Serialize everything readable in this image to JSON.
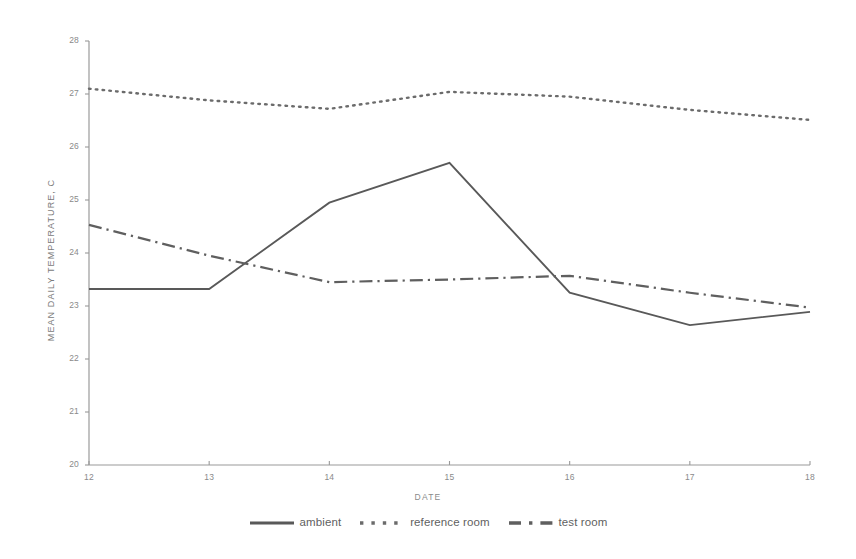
{
  "chart_data": {
    "type": "line",
    "title": "",
    "xlabel": "DATE",
    "ylabel": "MEAN DAILY TEMPERATURE, C",
    "x": [
      12,
      13,
      14,
      15,
      16,
      17,
      18
    ],
    "xlim": [
      12,
      18
    ],
    "ylim": [
      20,
      28
    ],
    "xticks": [
      "12",
      "13",
      "14",
      "15",
      "16",
      "17",
      "18"
    ],
    "yticks": [
      "20",
      "21",
      "22",
      "23",
      "24",
      "25",
      "26",
      "27",
      "28"
    ],
    "grid": false,
    "legend_position": "bottom",
    "series": [
      {
        "name": "ambient",
        "style": "solid",
        "color": "#595959",
        "values": [
          23.32,
          23.32,
          24.95,
          25.7,
          23.25,
          22.64,
          22.89
        ]
      },
      {
        "name": "reference room",
        "style": "dotted",
        "color": "#6b6b6b",
        "values": [
          27.1,
          26.88,
          26.72,
          27.04,
          26.95,
          26.7,
          26.51
        ]
      },
      {
        "name": "test room",
        "style": "dashdot",
        "color": "#5f5f5f",
        "values": [
          24.53,
          23.95,
          23.45,
          23.5,
          23.57,
          23.25,
          22.97
        ]
      }
    ]
  },
  "axis": {
    "y_title": "MEAN DAILY TEMPERATURE, C",
    "x_title": "DATE",
    "y_tick_labels": [
      "28",
      "27",
      "26",
      "25",
      "24",
      "23",
      "22",
      "21",
      "20"
    ],
    "x_tick_labels": [
      "12",
      "13",
      "14",
      "15",
      "16",
      "17",
      "18"
    ]
  },
  "legend": {
    "items": [
      {
        "label": "ambient",
        "style": "solid"
      },
      {
        "label": "reference room",
        "style": "dotted"
      },
      {
        "label": "test room",
        "style": "dashdot"
      }
    ]
  }
}
